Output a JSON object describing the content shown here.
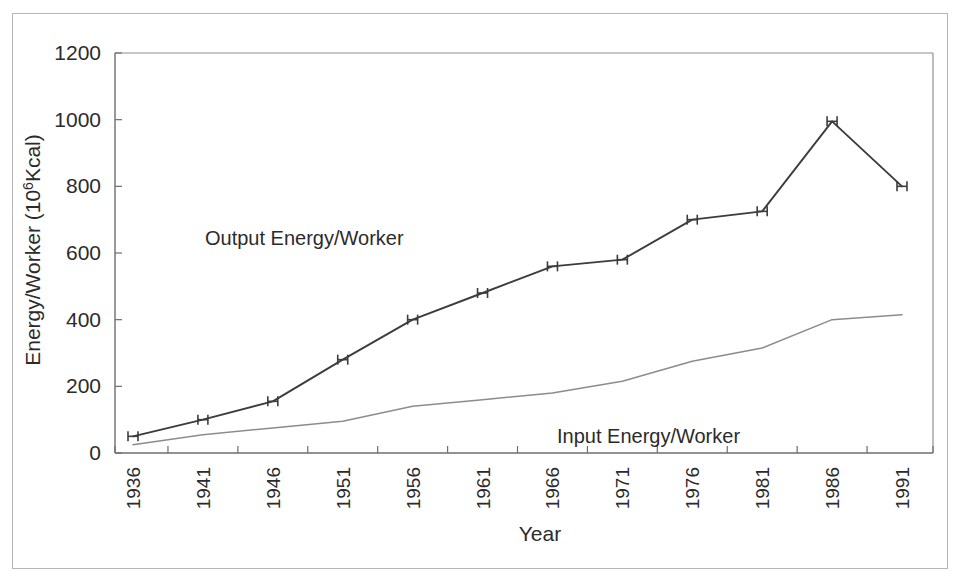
{
  "chart_data": {
    "type": "line",
    "title": "",
    "xlabel": "Year",
    "ylabel": "Energy/Worker  (10 6Kcal)",
    "ylabel_main": "Energy/Worker  (10",
    "ylabel_sup": "6",
    "ylabel_tail": "Kcal)",
    "categories": [
      "1936",
      "1941",
      "1946",
      "1951",
      "1956",
      "1961",
      "1966",
      "1971",
      "1976",
      "1981",
      "1986",
      "1991"
    ],
    "x": [
      1936,
      1941,
      1946,
      1951,
      1956,
      1961,
      1966,
      1971,
      1976,
      1981,
      1986,
      1991
    ],
    "ylim": [
      0,
      1200
    ],
    "yticks": [
      "0",
      "200",
      "400",
      "600",
      "800",
      "1000",
      "1200"
    ],
    "ytick_values": [
      0,
      200,
      400,
      600,
      800,
      1000,
      1200
    ],
    "grid": false,
    "legend_position": "inline-annotation",
    "series": [
      {
        "name": "Output Energy/Worker",
        "color": "#3c3c3c",
        "marker": "error-bar-h",
        "values": [
          50,
          100,
          155,
          280,
          400,
          480,
          560,
          580,
          700,
          725,
          995,
          800
        ]
      },
      {
        "name": "Input Energy/Worker",
        "color": "#8c8c8c",
        "marker": "none",
        "values": [
          25,
          55,
          75,
          95,
          140,
          160,
          180,
          215,
          275,
          315,
          400,
          415
        ]
      }
    ],
    "annotations": [
      {
        "text": "Output Energy/Worker",
        "x_px": 205,
        "y_px": 245
      },
      {
        "text": "Input Energy/Worker",
        "x_px": 557,
        "y_px": 443
      }
    ]
  },
  "axes": {
    "x_title": "Year",
    "y_title_prefix": "Energy/Worker  (10",
    "y_title_superscript": "6",
    "y_title_suffix": "Kcal)"
  },
  "colors": {
    "output_line": "#3c3c3c",
    "input_line": "#8c8c8c",
    "axis": "#6e6e6e",
    "frame": "#b6b6b6",
    "text": "#2b2b2b",
    "background": "#ffffff"
  }
}
